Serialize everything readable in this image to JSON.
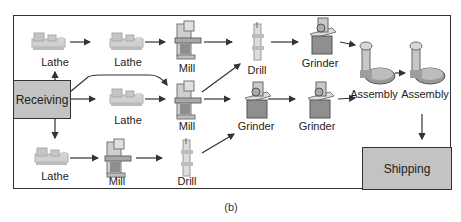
{
  "caption": "(b)",
  "boxes": {
    "receiving": "Receiving",
    "shipping": "Shipping"
  },
  "machines": [
    {
      "id": "lathe-1",
      "type": "lathe",
      "label": "Lathe"
    },
    {
      "id": "lathe-2",
      "type": "lathe",
      "label": "Lathe"
    },
    {
      "id": "mill-1",
      "type": "mill",
      "label": "Mill"
    },
    {
      "id": "drill-1",
      "type": "drill",
      "label": "Drill"
    },
    {
      "id": "grinder-1",
      "type": "grinder",
      "label": "Grinder"
    },
    {
      "id": "assembly-1",
      "type": "assembly",
      "label": "Assembly"
    },
    {
      "id": "assembly-2",
      "type": "assembly",
      "label": "Assembly"
    },
    {
      "id": "lathe-3",
      "type": "lathe",
      "label": "Lathe"
    },
    {
      "id": "mill-2",
      "type": "mill",
      "label": "Mill"
    },
    {
      "id": "grinder-2",
      "type": "grinder",
      "label": "Grinder"
    },
    {
      "id": "grinder-3",
      "type": "grinder",
      "label": "Grinder"
    },
    {
      "id": "lathe-4",
      "type": "lathe",
      "label": "Lathe"
    },
    {
      "id": "mill-3",
      "type": "mill",
      "label": "Mill"
    },
    {
      "id": "drill-2",
      "type": "drill",
      "label": "Drill"
    }
  ],
  "flows": [
    [
      "receiving",
      "lathe-1"
    ],
    [
      "lathe-1",
      "lathe-2"
    ],
    [
      "lathe-2",
      "mill-1"
    ],
    [
      "mill-1",
      "drill-1"
    ],
    [
      "drill-1",
      "grinder-1"
    ],
    [
      "grinder-1",
      "assembly-1"
    ],
    [
      "assembly-1",
      "assembly-2"
    ],
    [
      "assembly-2",
      "shipping"
    ],
    [
      "receiving",
      "mill-2"
    ],
    [
      "receiving",
      "lathe-3"
    ],
    [
      "lathe-3",
      "mill-2"
    ],
    [
      "mill-2",
      "drill-1"
    ],
    [
      "mill-2",
      "grinder-2"
    ],
    [
      "grinder-2",
      "grinder-3"
    ],
    [
      "grinder-3",
      "assembly-1"
    ],
    [
      "receiving",
      "lathe-4"
    ],
    [
      "lathe-4",
      "mill-3"
    ],
    [
      "mill-3",
      "drill-2"
    ],
    [
      "drill-2",
      "grinder-2"
    ]
  ],
  "colors": {
    "box_fill": "#c3c3c3",
    "line": "#333333",
    "machine_light": "#d8d8d8",
    "machine_mid": "#a9a9a9",
    "machine_dark": "#6f6f6f"
  }
}
